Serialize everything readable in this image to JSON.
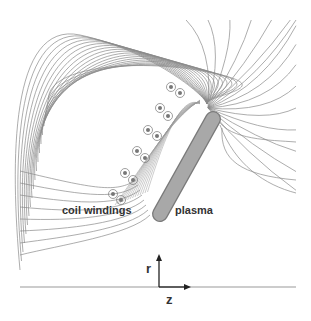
{
  "labels": {
    "coil": "coil windings",
    "plasma": "plasma",
    "r_axis": "r",
    "z_axis": "z"
  },
  "colors": {
    "field_line": "#8a8a8a",
    "plasma_fill": "#a8a8a8",
    "plasma_stroke": "#7a7a7a",
    "axis": "#222222",
    "baseline": "#999999"
  },
  "coils": [
    {
      "x": 171,
      "y": 87
    },
    {
      "x": 180,
      "y": 93
    },
    {
      "x": 160,
      "y": 108
    },
    {
      "x": 168,
      "y": 116
    },
    {
      "x": 148,
      "y": 130
    },
    {
      "x": 157,
      "y": 136
    },
    {
      "x": 137,
      "y": 151
    },
    {
      "x": 145,
      "y": 158
    },
    {
      "x": 125,
      "y": 173
    },
    {
      "x": 133,
      "y": 180
    },
    {
      "x": 113,
      "y": 194
    },
    {
      "x": 121,
      "y": 200
    }
  ]
}
